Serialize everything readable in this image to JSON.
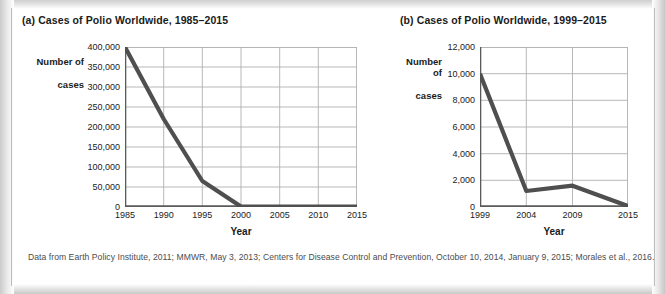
{
  "figure": {
    "source_note": "Data from Earth Policy Institute, 2011; MMWR, May 3, 2013; Centers for Disease Control and Prevention, October 10, 2014, January 9, 2015; Morales et al., 2016.",
    "line_color": "#4f4f4f",
    "grid_color": "#b0b0b0",
    "axis_color": "#5a5a5a",
    "text_color": "#1b1b1b"
  },
  "chart_data": [
    {
      "id": "panel-a",
      "type": "line",
      "title": "(a) Cases of Polio Worldwide, 1985–2015",
      "xlabel": "Year",
      "ylabel": "Number of\ncases",
      "ylabel_line1": "Number of",
      "ylabel_line2": "cases",
      "x": [
        1985,
        1990,
        1995,
        2000,
        2005,
        2010,
        2015
      ],
      "values": [
        400000,
        220000,
        65000,
        1000,
        1000,
        1000,
        800
      ],
      "xticks": [
        "1985",
        "1990",
        "1995",
        "2000",
        "2005",
        "2010",
        "2015"
      ],
      "yticks": [
        "0",
        "50,000",
        "100,000",
        "150,000",
        "200,000",
        "250,000",
        "300,000",
        "350,000",
        "400,000"
      ],
      "ytickvalues": [
        0,
        50000,
        100000,
        150000,
        200000,
        250000,
        300000,
        350000,
        400000
      ],
      "xlim": [
        1985,
        2015
      ],
      "ylim": [
        0,
        400000
      ],
      "grid": true,
      "legend": "none"
    },
    {
      "id": "panel-b",
      "type": "line",
      "title": "(b) Cases of Polio Worldwide, 1999–2015",
      "xlabel": "Year",
      "ylabel": "Number of\ncases",
      "ylabel_line1": "Number of",
      "ylabel_line2": "cases",
      "x": [
        1999,
        2004,
        2009,
        2015
      ],
      "values": [
        10000,
        1200,
        1600,
        70
      ],
      "xticks": [
        "1999",
        "2004",
        "2009",
        "2015"
      ],
      "yticks": [
        "0",
        "2,000",
        "4,000",
        "6,000",
        "8,000",
        "10,000",
        "12,000"
      ],
      "ytickvalues": [
        0,
        2000,
        4000,
        6000,
        8000,
        10000,
        12000
      ],
      "xlim": [
        1999,
        2015
      ],
      "ylim": [
        0,
        12000
      ],
      "grid": true,
      "legend": "none"
    }
  ]
}
